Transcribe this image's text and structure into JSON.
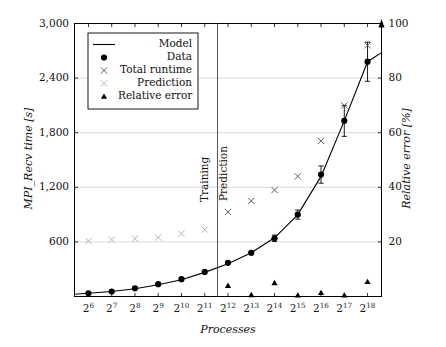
{
  "figure": {
    "background": "#ffffff",
    "frame_color": "#000000",
    "grid_color": "#cccccc"
  },
  "axes": {
    "x": {
      "label": "Processes",
      "scale": "log2",
      "tick_labels": [
        "2^6",
        "2^7",
        "2^8",
        "2^9",
        "2^10",
        "2^11",
        "2^12",
        "2^13",
        "2^14",
        "2^15",
        "2^16",
        "2^17",
        "2^18"
      ],
      "tick_bases": [
        "2",
        "2",
        "2",
        "2",
        "2",
        "2",
        "2",
        "2",
        "2",
        "2",
        "2",
        "2",
        "2"
      ],
      "tick_exponents": [
        "6",
        "7",
        "8",
        "9",
        "10",
        "11",
        "12",
        "13",
        "14",
        "15",
        "16",
        "17",
        "18"
      ],
      "min_exp": 5.4,
      "max_exp": 18.6
    },
    "y_left": {
      "label": "MPI_Recv time [s]",
      "tick_labels": [
        "600",
        "1,200",
        "1,800",
        "2,400",
        "3,000"
      ],
      "tick_values": [
        600,
        1200,
        1800,
        2400,
        3000
      ],
      "min": 0,
      "max": 3000
    },
    "y_right": {
      "label": "Relative error [%]",
      "tick_labels": [
        "20",
        "40",
        "60",
        "80",
        "100"
      ],
      "tick_values": [
        20,
        40,
        60,
        80,
        100
      ],
      "min": 0,
      "max": 100,
      "has_arrow_head": true
    }
  },
  "legend": {
    "entries": [
      {
        "label": "Model",
        "marker": "line",
        "color": "#000000"
      },
      {
        "label": "Data",
        "marker": "circle",
        "color": "#000000"
      },
      {
        "label": "Total runtime",
        "marker": "cross",
        "color": "#555555"
      },
      {
        "label": "Prediction",
        "marker": "cross",
        "color": "#b0b0b0"
      },
      {
        "label": "Relative error",
        "marker": "triangle",
        "color": "#000000"
      }
    ]
  },
  "regions": [
    {
      "name": "training",
      "label": "Training",
      "side": "left"
    },
    {
      "name": "prediction",
      "label": "Prediction",
      "side": "right"
    }
  ],
  "divider": {
    "at_exponent": 11.55
  },
  "chart_data": {
    "type": "scatter",
    "title": "",
    "xlabel": "Processes",
    "ylabel": "MPI_Recv time [s]",
    "y2label": "Relative error [%]",
    "xlim": [
      5.4,
      18.6
    ],
    "ylim": [
      0,
      3000
    ],
    "y2lim": [
      0,
      100
    ],
    "grid": true,
    "legend_position": "upper-left-inside",
    "x": [
      6,
      7,
      8,
      9,
      10,
      11,
      12,
      13,
      14,
      15,
      16,
      17,
      18
    ],
    "series": [
      {
        "name": "Model",
        "type": "line",
        "axis": "left",
        "color": "#000000",
        "x": [
          5.4,
          6,
          7,
          8,
          9,
          10,
          11,
          12,
          13,
          14,
          15,
          16,
          17,
          18,
          18.6
        ],
        "values": [
          25,
          35,
          55,
          85,
          130,
          185,
          265,
          360,
          480,
          645,
          900,
          1320,
          1930,
          2580,
          2680
        ]
      },
      {
        "name": "Data",
        "type": "points",
        "axis": "left",
        "color": "#000000",
        "x": [
          6,
          7,
          8,
          9,
          10,
          11,
          12,
          13,
          14,
          15,
          16,
          17,
          18
        ],
        "values": [
          35,
          55,
          90,
          135,
          190,
          270,
          370,
          480,
          640,
          900,
          1340,
          1930,
          2580
        ],
        "errors": [
          0,
          0,
          0,
          0,
          0,
          0,
          10,
          15,
          35,
          50,
          95,
          170,
          215
        ]
      },
      {
        "name": "Total runtime",
        "type": "points",
        "axis": "right",
        "marker": "cross",
        "color": "#555555",
        "x": [
          12,
          13,
          14,
          15,
          16,
          17,
          18
        ],
        "values": [
          31,
          35,
          39,
          44,
          57,
          70,
          92
        ]
      },
      {
        "name": "Prediction",
        "type": "points",
        "axis": "right",
        "marker": "cross",
        "color": "#b0b0b0",
        "x": [
          6,
          7,
          8,
          9,
          10,
          11
        ],
        "values": [
          20.3,
          20.8,
          21.2,
          21.6,
          23.0,
          24.5
        ]
      },
      {
        "name": "Relative error",
        "type": "points",
        "axis": "right",
        "marker": "triangle",
        "color": "#000000",
        "x": [
          12,
          13,
          14,
          15,
          16,
          17,
          18
        ],
        "values": [
          4.0,
          0.6,
          5.0,
          0.5,
          1.4,
          0.5,
          5.4
        ]
      }
    ]
  }
}
